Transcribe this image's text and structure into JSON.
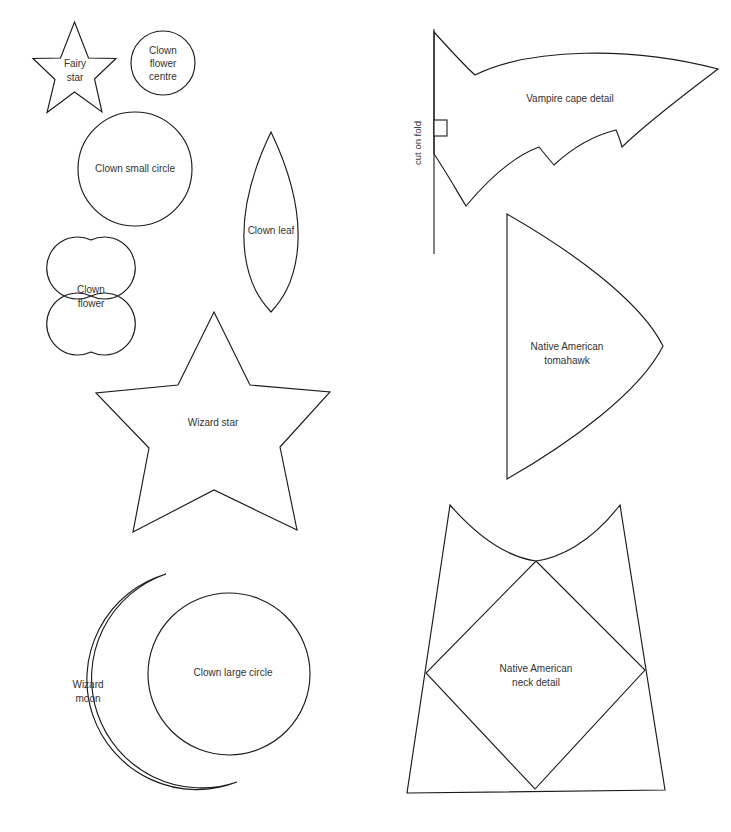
{
  "document": {
    "title": "Costume pattern template sheet",
    "background_color": "#ffffff",
    "stroke_color": "#1c1c1c",
    "text_color": "#333333",
    "width": 731,
    "height": 832
  },
  "shapes": {
    "fairy_star": {
      "label": "Fairy\nstar",
      "line1": "Fairy",
      "line2": "star"
    },
    "clown_flower_centre": {
      "label": "Clown flower centre",
      "line1": "Clown",
      "line2": "flower",
      "line3": "centre"
    },
    "clown_small_circle": {
      "label": "Clown small circle",
      "line1": "Clown small circle"
    },
    "clown_flower": {
      "label": "Clown flower",
      "line1": "Clown",
      "line2": "flower"
    },
    "clown_leaf": {
      "label": "Clown leaf",
      "line1": "Clown leaf"
    },
    "wizard_star": {
      "label": "Wizard star",
      "line1": "Wizard star"
    },
    "wizard_moon": {
      "label": "Wizard moon",
      "line1": "Wizard",
      "line2": "moon"
    },
    "clown_large_circle": {
      "label": "Clown large circle",
      "line1": "Clown large circle"
    },
    "vampire_cape": {
      "label": "Vampire cape detail",
      "line1": "Vampire cape detail",
      "fold_label": "cut on fold"
    },
    "native_american_tomahawk": {
      "label": "Native American tomahawk",
      "line1": "Native American",
      "line2": "tomahawk"
    },
    "native_american_neck_detail": {
      "label": "Native American neck detail",
      "line1": "Native American",
      "line2": "neck detail"
    }
  }
}
